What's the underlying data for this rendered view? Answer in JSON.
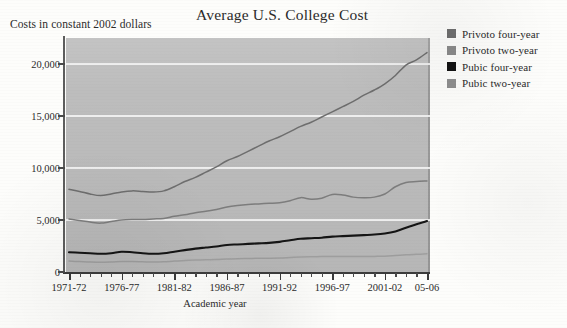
{
  "chart_data": {
    "type": "line",
    "title": "Average U.S. College Cost",
    "subtitle": "Costs in constant 2002 dollars",
    "xlabel": "Academic year",
    "ylabel": "",
    "ylim": [
      0,
      22500
    ],
    "yticks": [
      "0",
      "5,000",
      "10,000",
      "15,000",
      "20,000"
    ],
    "ytick_values": [
      0,
      5000,
      10000,
      15000,
      20000
    ],
    "grid": "horizontal",
    "legend_position": "right",
    "categories": [
      "1971-72",
      "1972-73",
      "1973-74",
      "1974-75",
      "1975-76",
      "1976-77",
      "1977-78",
      "1978-79",
      "1979-80",
      "1980-81",
      "1981-82",
      "1982-83",
      "1983-84",
      "1984-85",
      "1985-86",
      "1986-87",
      "1987-88",
      "1988-89",
      "1989-90",
      "1990-91",
      "1991-92",
      "1992-93",
      "1993-94",
      "1994-95",
      "1995-96",
      "1996-97",
      "1997-98",
      "1998-99",
      "1999-00",
      "2000-01",
      "2001-02",
      "2002-03",
      "2003-04",
      "2004-05",
      "2005-06"
    ],
    "xtick_labels": [
      "1971-72",
      "1976-77",
      "1981-82",
      "1986-87",
      "1991-92",
      "1996-97",
      "2001-02",
      "05-06"
    ],
    "xtick_indices": [
      0,
      5,
      10,
      15,
      20,
      25,
      30,
      34
    ],
    "series": [
      {
        "name": "Privoto four-year",
        "color": "#6e6e6e",
        "values": [
          7950,
          7750,
          7500,
          7350,
          7500,
          7700,
          7800,
          7750,
          7700,
          7800,
          8200,
          8700,
          9100,
          9600,
          10100,
          10700,
          11100,
          11600,
          12100,
          12600,
          13000,
          13500,
          14000,
          14400,
          14900,
          15400,
          15900,
          16400,
          17000,
          17500,
          18100,
          18900,
          19900,
          20400,
          21100
        ]
      },
      {
        "name": "Privoto two-year",
        "color": "#7d7d7d",
        "values": [
          5100,
          4950,
          4800,
          4700,
          4850,
          5000,
          5050,
          5050,
          5100,
          5150,
          5350,
          5500,
          5700,
          5850,
          6000,
          6250,
          6400,
          6500,
          6550,
          6600,
          6650,
          6850,
          7150,
          7000,
          7100,
          7450,
          7400,
          7200,
          7150,
          7200,
          7500,
          8200,
          8600,
          8700,
          8750
        ]
      },
      {
        "name": "Pubic four-year",
        "color": "#151515",
        "values": [
          1900,
          1850,
          1800,
          1750,
          1800,
          1950,
          1900,
          1800,
          1750,
          1800,
          1950,
          2100,
          2250,
          2350,
          2450,
          2600,
          2650,
          2700,
          2750,
          2800,
          2900,
          3050,
          3200,
          3250,
          3300,
          3400,
          3450,
          3500,
          3550,
          3600,
          3700,
          3900,
          4250,
          4600,
          4900
        ]
      },
      {
        "name": "Pubic two-year",
        "color": "#9a9a9a",
        "values": [
          1050,
          1000,
          950,
          930,
          950,
          1000,
          1000,
          980,
          960,
          980,
          1050,
          1100,
          1150,
          1180,
          1200,
          1250,
          1280,
          1300,
          1320,
          1330,
          1350,
          1400,
          1450,
          1470,
          1480,
          1500,
          1500,
          1490,
          1480,
          1500,
          1520,
          1580,
          1650,
          1700,
          1750
        ]
      }
    ]
  },
  "legend": {
    "items": [
      {
        "label": "Privoto four-year",
        "color": "#6e6e6e"
      },
      {
        "label": "Privoto two-year",
        "color": "#8a8a8a"
      },
      {
        "label": "Pubic four-year",
        "color": "#121212"
      },
      {
        "label": "Pubic two-year",
        "color": "#8f8f8f"
      }
    ]
  },
  "plot_style": {
    "background": "#bdbdbd",
    "gridline_color": "#f2f2f2",
    "axis_color": "#3c3c3c"
  }
}
